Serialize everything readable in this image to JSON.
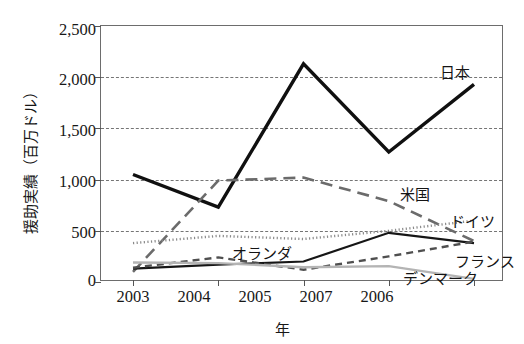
{
  "chart_data": {
    "type": "line",
    "title": "",
    "xlabel": "年",
    "ylabel": "援助実績（百万ドル）",
    "categories": [
      "2003",
      "2004",
      "2005",
      "2006",
      "2007"
    ],
    "x": [
      2003,
      2004,
      2005,
      2006,
      2007
    ],
    "ylim": [
      0,
      2500
    ],
    "yticks": [
      "0",
      "500",
      "1,000",
      "1,500",
      "2,000",
      "2,500"
    ],
    "ytick_values": [
      0,
      500,
      1000,
      1500,
      2000,
      2500
    ],
    "grid": "horizontal-dashed",
    "gridline_values": [
      500,
      1000,
      1500,
      2000
    ],
    "legend_position": "inline-annotations",
    "series": [
      {
        "name": "日本",
        "label": "日本",
        "values": [
          1050,
          730,
          2130,
          1270,
          1930
        ],
        "color": "#101010",
        "style": "solid",
        "width": 3.4,
        "label_x": 440,
        "label_y": 66
      },
      {
        "name": "米国",
        "label": "米国",
        "values": [
          100,
          990,
          1020,
          790,
          400
        ],
        "color": "#6b6b6b",
        "style": "long-dash",
        "width": 2.6,
        "label_x": 400,
        "label_y": 188
      },
      {
        "name": "ドイツ",
        "label": "ドイツ",
        "values": [
          380,
          450,
          420,
          500,
          600
        ],
        "color": "#8a8a8a",
        "style": "dotted",
        "width": 2.4,
        "label_x": 450,
        "label_y": 215
      },
      {
        "name": "オランダ",
        "label": "オランダ",
        "values": [
          130,
          170,
          200,
          480,
          380
        ],
        "color": "#161616",
        "style": "solid",
        "width": 2.2,
        "label_x": 232,
        "label_y": 247
      },
      {
        "name": "フランス",
        "label": "フランス",
        "values": [
          140,
          240,
          120,
          250,
          395
        ],
        "color": "#4f4f4f",
        "style": "dash",
        "width": 2.4,
        "label_x": 455,
        "label_y": 255
      },
      {
        "name": "デンマーク",
        "label": "デンマーク",
        "values": [
          190,
          185,
          145,
          155,
          30
        ],
        "color": "#b4b4b4",
        "style": "solid",
        "width": 2.4,
        "label_x": 403,
        "label_y": 272
      }
    ]
  },
  "axes": {
    "y_title": "援助実績（百万ドル）",
    "x_title": "年",
    "y_ticks": [
      "2,500",
      "2,000",
      "1,500",
      "1,000",
      "500",
      "0"
    ],
    "x_ticks": [
      "2003",
      "2004",
      "2005",
      "2006",
      "2007"
    ]
  }
}
